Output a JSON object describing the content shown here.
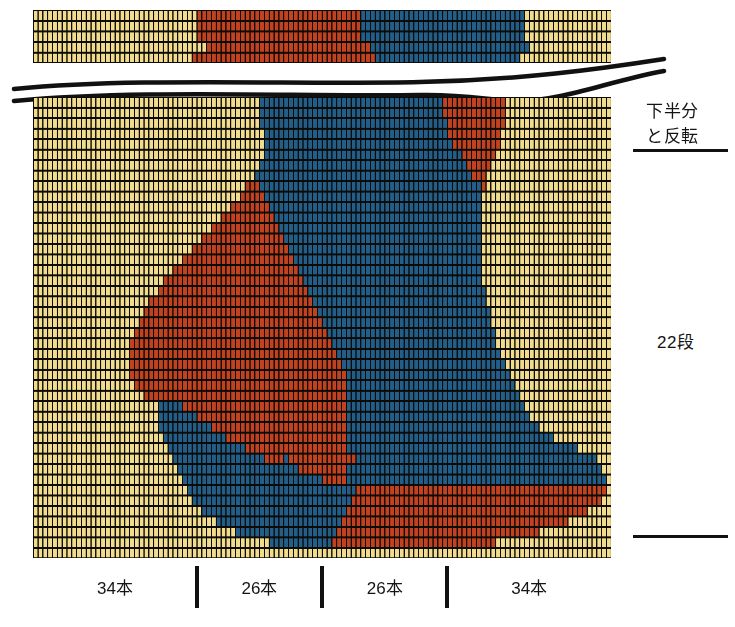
{
  "colors": {
    "cream": "#F0DC8C",
    "red": "#C2411E",
    "blue": "#215F8A",
    "grid_line": "#0d0b07",
    "ink": "#141414"
  },
  "grid": {
    "columns": 120,
    "top_strip_rows": 5,
    "main_rows": 44,
    "cell_width": 4.817,
    "cell_height": 10.48,
    "top_strip_cell_height": 10.6,
    "bead_inset_x": 1.2,
    "bead_inset_y": 2.0
  },
  "annotations": {
    "note_line1": "下半分",
    "note_line2": "と反転",
    "row_count": "22段"
  },
  "bottom_legend": {
    "segments": [
      {
        "label": "34本",
        "columns": 34
      },
      {
        "label": "26本",
        "columns": 26
      },
      {
        "label": "26本",
        "columns": 26
      },
      {
        "label": "34本",
        "columns": 34
      }
    ],
    "tick_count": 3
  },
  "chart_data": {
    "type": "heatmap",
    "xlabel": "",
    "ylabel": "",
    "legend_position": "bottom",
    "grid": true,
    "palette": {
      "0": "#F0DC8C",
      "1": "#C2411E",
      "2": "#215F8A"
    },
    "palette_names": {
      "0": "cream",
      "1": "red",
      "2": "blue"
    },
    "columns": 120,
    "top_strip": {
      "rows": 5,
      "runs": [
        [
          [
            0,
            34,
            0
          ],
          [
            34,
            34,
            1
          ],
          [
            68,
            34,
            2
          ],
          [
            102,
            18,
            0
          ]
        ],
        [
          [
            0,
            34,
            0
          ],
          [
            34,
            34,
            1
          ],
          [
            68,
            34,
            2
          ],
          [
            102,
            18,
            0
          ]
        ],
        [
          [
            0,
            34,
            0
          ],
          [
            34,
            34,
            1
          ],
          [
            68,
            34,
            2
          ],
          [
            102,
            18,
            0
          ]
        ],
        [
          [
            0,
            36,
            0
          ],
          [
            36,
            34,
            1
          ],
          [
            70,
            33,
            2
          ],
          [
            103,
            17,
            0
          ]
        ],
        [
          [
            0,
            33,
            0
          ],
          [
            33,
            38,
            1
          ],
          [
            71,
            30,
            2
          ],
          [
            101,
            19,
            0
          ]
        ]
      ]
    },
    "main": {
      "rows": 44,
      "runs": [
        [
          [
            0,
            47,
            0
          ],
          [
            47,
            38,
            2
          ],
          [
            85,
            13,
            1
          ],
          [
            98,
            22,
            0
          ]
        ],
        [
          [
            0,
            47,
            0
          ],
          [
            47,
            38,
            2
          ],
          [
            85,
            13,
            1
          ],
          [
            98,
            22,
            0
          ]
        ],
        [
          [
            0,
            47,
            0
          ],
          [
            47,
            39,
            2
          ],
          [
            86,
            12,
            1
          ],
          [
            98,
            22,
            0
          ]
        ],
        [
          [
            0,
            48,
            0
          ],
          [
            48,
            38,
            2
          ],
          [
            86,
            11,
            1
          ],
          [
            97,
            23,
            0
          ]
        ],
        [
          [
            0,
            48,
            0
          ],
          [
            48,
            39,
            2
          ],
          [
            87,
            10,
            1
          ],
          [
            97,
            23,
            0
          ]
        ],
        [
          [
            0,
            48,
            0
          ],
          [
            48,
            41,
            2
          ],
          [
            89,
            7,
            1
          ],
          [
            96,
            24,
            0
          ]
        ],
        [
          [
            0,
            47,
            0
          ],
          [
            47,
            43,
            2
          ],
          [
            90,
            5,
            1
          ],
          [
            95,
            25,
            0
          ]
        ],
        [
          [
            0,
            46,
            0
          ],
          [
            46,
            45,
            2
          ],
          [
            91,
            3,
            1
          ],
          [
            94,
            26,
            0
          ]
        ],
        [
          [
            0,
            44,
            0
          ],
          [
            44,
            3,
            1
          ],
          [
            47,
            46,
            2
          ],
          [
            93,
            1,
            1
          ],
          [
            94,
            26,
            0
          ]
        ],
        [
          [
            0,
            43,
            0
          ],
          [
            43,
            5,
            1
          ],
          [
            48,
            45,
            2
          ],
          [
            93,
            27,
            0
          ]
        ],
        [
          [
            0,
            41,
            0
          ],
          [
            41,
            8,
            1
          ],
          [
            49,
            44,
            2
          ],
          [
            93,
            27,
            0
          ]
        ],
        [
          [
            0,
            39,
            0
          ],
          [
            39,
            11,
            1
          ],
          [
            50,
            43,
            2
          ],
          [
            93,
            27,
            0
          ]
        ],
        [
          [
            0,
            37,
            0
          ],
          [
            37,
            14,
            1
          ],
          [
            51,
            42,
            2
          ],
          [
            93,
            27,
            0
          ]
        ],
        [
          [
            0,
            35,
            0
          ],
          [
            35,
            17,
            1
          ],
          [
            52,
            41,
            2
          ],
          [
            93,
            27,
            0
          ]
        ],
        [
          [
            0,
            33,
            0
          ],
          [
            33,
            20,
            1
          ],
          [
            53,
            40,
            2
          ],
          [
            93,
            27,
            0
          ]
        ],
        [
          [
            0,
            31,
            0
          ],
          [
            31,
            23,
            1
          ],
          [
            54,
            39,
            2
          ],
          [
            93,
            27,
            0
          ]
        ],
        [
          [
            0,
            29,
            0
          ],
          [
            29,
            26,
            1
          ],
          [
            55,
            38,
            2
          ],
          [
            93,
            27,
            0
          ]
        ],
        [
          [
            0,
            27,
            0
          ],
          [
            27,
            29,
            1
          ],
          [
            56,
            37,
            2
          ],
          [
            93,
            27,
            0
          ]
        ],
        [
          [
            0,
            26,
            0
          ],
          [
            26,
            31,
            1
          ],
          [
            57,
            37,
            2
          ],
          [
            94,
            26,
            0
          ]
        ],
        [
          [
            0,
            24,
            0
          ],
          [
            24,
            34,
            1
          ],
          [
            58,
            36,
            2
          ],
          [
            94,
            26,
            0
          ]
        ],
        [
          [
            0,
            23,
            0
          ],
          [
            23,
            36,
            1
          ],
          [
            59,
            36,
            2
          ],
          [
            95,
            25,
            0
          ]
        ],
        [
          [
            0,
            22,
            0
          ],
          [
            22,
            38,
            1
          ],
          [
            60,
            35,
            2
          ],
          [
            95,
            25,
            0
          ]
        ],
        [
          [
            0,
            21,
            0
          ],
          [
            21,
            40,
            1
          ],
          [
            61,
            35,
            2
          ],
          [
            96,
            24,
            0
          ]
        ],
        [
          [
            0,
            20,
            0
          ],
          [
            20,
            42,
            1
          ],
          [
            62,
            34,
            2
          ],
          [
            96,
            24,
            0
          ]
        ],
        [
          [
            0,
            20,
            0
          ],
          [
            20,
            43,
            1
          ],
          [
            63,
            34,
            2
          ],
          [
            97,
            23,
            0
          ]
        ],
        [
          [
            0,
            20,
            0
          ],
          [
            20,
            44,
            1
          ],
          [
            64,
            34,
            2
          ],
          [
            98,
            22,
            0
          ]
        ],
        [
          [
            0,
            20,
            0
          ],
          [
            20,
            45,
            1
          ],
          [
            65,
            34,
            2
          ],
          [
            99,
            21,
            0
          ]
        ],
        [
          [
            0,
            21,
            0
          ],
          [
            21,
            44,
            1
          ],
          [
            65,
            35,
            2
          ],
          [
            100,
            20,
            0
          ]
        ],
        [
          [
            0,
            23,
            0
          ],
          [
            23,
            42,
            1
          ],
          [
            65,
            36,
            2
          ],
          [
            101,
            19,
            0
          ]
        ],
        [
          [
            0,
            26,
            0
          ],
          [
            26,
            5,
            2
          ],
          [
            31,
            34,
            1
          ],
          [
            65,
            37,
            2
          ],
          [
            102,
            18,
            0
          ]
        ],
        [
          [
            0,
            26,
            0
          ],
          [
            26,
            8,
            2
          ],
          [
            34,
            31,
            1
          ],
          [
            65,
            38,
            2
          ],
          [
            103,
            17,
            0
          ]
        ],
        [
          [
            0,
            26,
            0
          ],
          [
            26,
            11,
            2
          ],
          [
            37,
            28,
            1
          ],
          [
            65,
            40,
            2
          ],
          [
            105,
            15,
            0
          ]
        ],
        [
          [
            0,
            27,
            0
          ],
          [
            27,
            13,
            2
          ],
          [
            40,
            25,
            1
          ],
          [
            65,
            43,
            2
          ],
          [
            108,
            12,
            0
          ]
        ],
        [
          [
            0,
            28,
            0
          ],
          [
            28,
            16,
            2
          ],
          [
            44,
            21,
            1
          ],
          [
            65,
            48,
            2
          ],
          [
            113,
            7,
            0
          ]
        ],
        [
          [
            0,
            29,
            0
          ],
          [
            29,
            19,
            2
          ],
          [
            48,
            4,
            1
          ],
          [
            52,
            1,
            2
          ],
          [
            53,
            14,
            1
          ],
          [
            67,
            50,
            2
          ],
          [
            117,
            3,
            0
          ]
        ],
        [
          [
            0,
            30,
            0
          ],
          [
            30,
            25,
            2
          ],
          [
            55,
            10,
            1
          ],
          [
            65,
            53,
            2
          ],
          [
            118,
            2,
            0
          ]
        ],
        [
          [
            0,
            31,
            0
          ],
          [
            31,
            29,
            2
          ],
          [
            60,
            5,
            1
          ],
          [
            65,
            54,
            2
          ],
          [
            119,
            1,
            0
          ]
        ],
        [
          [
            0,
            32,
            0
          ],
          [
            32,
            35,
            2
          ],
          [
            67,
            52,
            1
          ],
          [
            119,
            1,
            0
          ]
        ],
        [
          [
            0,
            33,
            0
          ],
          [
            33,
            33,
            2
          ],
          [
            66,
            52,
            1
          ],
          [
            118,
            2,
            0
          ]
        ],
        [
          [
            0,
            35,
            0
          ],
          [
            35,
            30,
            2
          ],
          [
            65,
            50,
            1
          ],
          [
            115,
            5,
            0
          ]
        ],
        [
          [
            0,
            38,
            0
          ],
          [
            38,
            26,
            2
          ],
          [
            64,
            47,
            1
          ],
          [
            111,
            9,
            0
          ]
        ],
        [
          [
            0,
            42,
            0
          ],
          [
            42,
            21,
            2
          ],
          [
            63,
            42,
            1
          ],
          [
            105,
            15,
            0
          ]
        ],
        [
          [
            0,
            49,
            0
          ],
          [
            49,
            13,
            2
          ],
          [
            62,
            34,
            1
          ],
          [
            96,
            24,
            0
          ]
        ],
        [
          [
            0,
            120,
            0
          ]
        ]
      ]
    }
  }
}
